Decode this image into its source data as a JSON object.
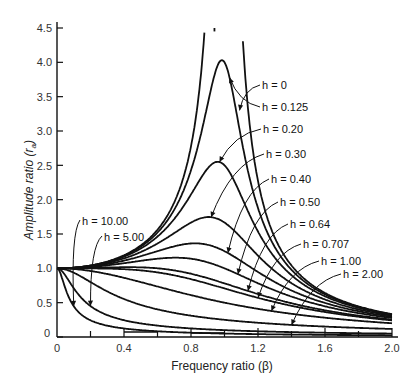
{
  "chart_data": {
    "type": "line",
    "title": "",
    "xlabel": "Frequency ratio (β)",
    "ylabel": "Amplitude ratio (r_a)",
    "xlim": [
      0,
      2.0
    ],
    "ylim": [
      0,
      4.5
    ],
    "x_ticks": [
      "0",
      "0.4",
      "0.8",
      "1.2",
      "1.6",
      "2.0"
    ],
    "x_minor_ticks": [
      0.2,
      0.6,
      1.0,
      1.4,
      1.8
    ],
    "y_ticks": [
      "0",
      "0.5",
      "1.0",
      "1.5",
      "2.0",
      "2.5",
      "3.0",
      "3.5",
      "4.0",
      "4.5"
    ],
    "grid": false,
    "legend": "inline labels with arrows",
    "formula": "r_a = 1 / sqrt((1 - β²)² + (2hβ)²)",
    "series": [
      {
        "name": "h = 0",
        "h": 0,
        "peak": "∞ at β = 1.0"
      },
      {
        "name": "h = 0.125",
        "h": 0.125,
        "peak": 4.03
      },
      {
        "name": "h = 0.20",
        "h": 0.2,
        "peak": 2.55
      },
      {
        "name": "h = 0.30",
        "h": 0.3,
        "peak": 1.75
      },
      {
        "name": "h = 0.40",
        "h": 0.4,
        "peak": 1.36
      },
      {
        "name": "h = 0.50",
        "h": 0.5,
        "peak": 1.15
      },
      {
        "name": "h = 0.64",
        "h": 0.64,
        "peak": 1.02
      },
      {
        "name": "h = 0.707",
        "h": 0.707,
        "peak": 1.0
      },
      {
        "name": "h = 1.00",
        "h": 1.0,
        "peak": 1.0
      },
      {
        "name": "h = 2.00",
        "h": 2.0,
        "peak": 1.0
      },
      {
        "name": "h = 5.00",
        "h": 5.0,
        "peak": 1.0
      },
      {
        "name": "h = 10.00",
        "h": 10.0,
        "peak": 1.0
      }
    ],
    "sample_values": {
      "beta": [
        0,
        0.4,
        0.8,
        1.0,
        1.2,
        1.6,
        2.0
      ],
      "h=0.20": [
        1.0,
        1.17,
        2.04,
        2.5,
        1.54,
        0.61,
        0.32
      ],
      "h=0.50": [
        1.0,
        1.1,
        1.22,
        1.0,
        0.8,
        0.46,
        0.28
      ],
      "h=1.00": [
        1.0,
        0.86,
        0.61,
        0.5,
        0.41,
        0.28,
        0.2
      ],
      "h=2.00": [
        1.0,
        0.53,
        0.3,
        0.25,
        0.21,
        0.16,
        0.12
      ]
    }
  },
  "labels": {
    "h0": "h = 0",
    "h0125": "h = 0.125",
    "h020": "h = 0.20",
    "h030": "h = 0.30",
    "h040": "h = 0.40",
    "h050": "h = 0.50",
    "h064": "h = 0.64",
    "h0707": "h = 0.707",
    "h100": "h = 1.00",
    "h200": "h = 2.00",
    "h500": "h = 5.00",
    "h1000": "h = 10.00"
  },
  "axes": {
    "xlabel": "Frequency ratio (β)",
    "ylabel": "Amplitude ratio (r",
    "ylabel_sub": "a",
    "ylabel_close": ")",
    "x0": "0",
    "y0": "0"
  }
}
